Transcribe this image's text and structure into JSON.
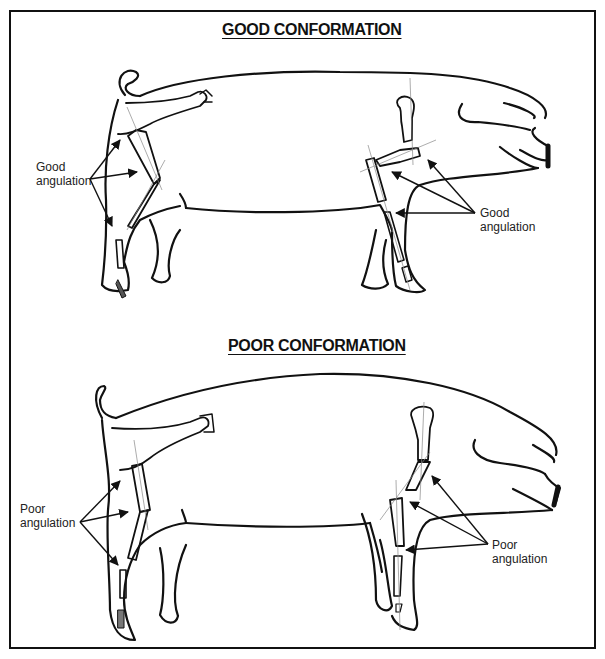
{
  "figure": {
    "panels": [
      {
        "id": "good",
        "title": "GOOD CONFORMATION",
        "rear_label": [
          "Good",
          "angulation"
        ],
        "front_label": [
          "Good",
          "angulation"
        ]
      },
      {
        "id": "poor",
        "title": "POOR CONFORMATION",
        "rear_label": [
          "Poor",
          "angulation"
        ],
        "front_label": [
          "Poor",
          "angulation"
        ]
      }
    ],
    "colors": {
      "line": "#111111",
      "guide": "#888888",
      "background": "#ffffff"
    }
  }
}
